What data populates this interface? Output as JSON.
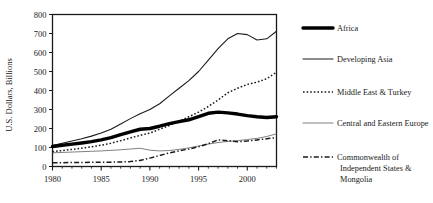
{
  "chart_data": {
    "type": "line",
    "title": "",
    "xlabel": "",
    "ylabel": "U.S. Dollars, Billions",
    "xlim": [
      1980,
      2003
    ],
    "ylim": [
      0,
      800
    ],
    "ytick_values": [
      0,
      100,
      200,
      300,
      400,
      500,
      600,
      700,
      800
    ],
    "ytick_labels": [
      "0",
      "100",
      "200",
      "300",
      "400",
      "500",
      "600",
      "700",
      "800"
    ],
    "xtick_values": [
      1980,
      1985,
      1990,
      1995,
      2000
    ],
    "xtick_labels": [
      "1980",
      "1985",
      "1990",
      "1995",
      "2000"
    ],
    "minor_xticks": true,
    "grid": false,
    "legend_position": "right",
    "x": [
      1980,
      1981,
      1982,
      1983,
      1984,
      1985,
      1986,
      1987,
      1988,
      1989,
      1990,
      1991,
      1992,
      1993,
      1994,
      1995,
      1996,
      1997,
      1998,
      1999,
      2000,
      2001,
      2002,
      2003
    ],
    "series": [
      {
        "name": "Africa",
        "style": "thick-solid",
        "color": "#000000",
        "values": [
          105,
          112,
          118,
          124,
          131,
          140,
          152,
          168,
          182,
          196,
          200,
          212,
          226,
          236,
          246,
          262,
          280,
          286,
          282,
          276,
          268,
          262,
          258,
          262
        ]
      },
      {
        "name": "Developing Asia",
        "style": "thin-solid",
        "color": "#1a1a1a",
        "values": [
          110,
          122,
          134,
          146,
          160,
          176,
          196,
          224,
          252,
          278,
          300,
          330,
          372,
          412,
          452,
          500,
          560,
          620,
          672,
          700,
          694,
          666,
          672,
          712
        ]
      },
      {
        "name": "Middle East & Turkey",
        "style": "dotted",
        "color": "#1a1a1a",
        "values": [
          78,
          84,
          90,
          96,
          104,
          112,
          122,
          136,
          150,
          164,
          176,
          196,
          216,
          238,
          262,
          286,
          316,
          350,
          388,
          412,
          432,
          444,
          462,
          496
        ]
      },
      {
        "name": "Central and Eastern Europe",
        "style": "hairline-solid",
        "color": "#555555",
        "values": [
          72,
          74,
          76,
          78,
          80,
          82,
          85,
          88,
          92,
          96,
          86,
          82,
          84,
          90,
          98,
          108,
          118,
          126,
          132,
          136,
          142,
          148,
          158,
          172
        ]
      },
      {
        "name": "Commonwealth of Independent States & Mongolia",
        "style": "dash-dot",
        "color": "#1a1a1a",
        "values": [
          20,
          20,
          21,
          21,
          22,
          22,
          23,
          24,
          26,
          32,
          44,
          58,
          72,
          82,
          92,
          104,
          120,
          140,
          136,
          130,
          134,
          140,
          146,
          152
        ]
      }
    ],
    "legend": [
      {
        "label": "Africa",
        "style": "thick-solid"
      },
      {
        "label": "Developing Asia",
        "style": "thin-solid"
      },
      {
        "label": "Middle East & Turkey",
        "style": "dotted"
      },
      {
        "label": "Central and Eastern Europe",
        "style": "hairline-solid"
      },
      {
        "label": "Commonwealth of",
        "label2": "Independent States &",
        "label3": "Mongolia",
        "style": "dash-dot"
      }
    ]
  }
}
